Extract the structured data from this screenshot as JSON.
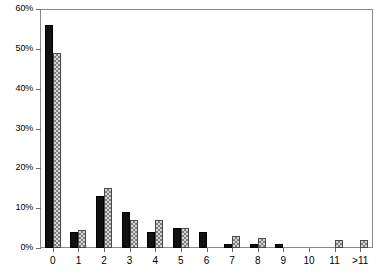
{
  "chart_data": {
    "type": "bar",
    "title": "",
    "subtitle": "",
    "xlabel": "",
    "ylabel": "",
    "categories": [
      "0",
      "1",
      "2",
      "3",
      "4",
      "5",
      "6",
      "7",
      "8",
      "9",
      "10",
      "11",
      ">11"
    ],
    "series": [
      {
        "name": "series-1-solid-black",
        "color": "#111111",
        "values": [
          56,
          4,
          13,
          9,
          4,
          5,
          4,
          1,
          1,
          1,
          0,
          0,
          0
        ]
      },
      {
        "name": "series-2-hatched-gray",
        "color": "#d6d6d6",
        "values": [
          49,
          4.5,
          15,
          7,
          7,
          5,
          0,
          3,
          2.5,
          0,
          0,
          2,
          2
        ]
      }
    ],
    "ylim": [
      0,
      60
    ],
    "yticks": [
      0,
      10,
      20,
      30,
      40,
      50,
      60
    ],
    "ytick_labels": [
      "0%",
      "10%",
      "20%",
      "30%",
      "40%",
      "50%",
      "60%"
    ],
    "grid": false,
    "legend": "none",
    "legend_position": "none"
  },
  "axes": {
    "y_axis_name": "percentage-axis",
    "x_axis_name": "count-axis"
  }
}
